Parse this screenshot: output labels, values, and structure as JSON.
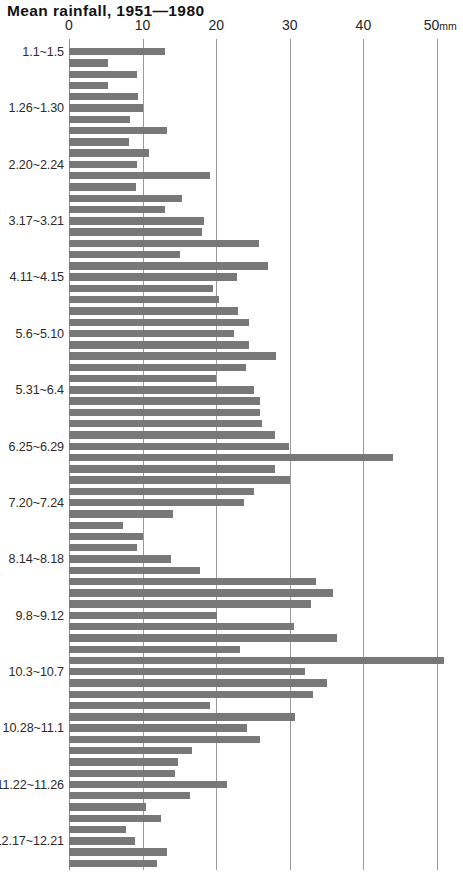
{
  "chart": {
    "title": "Mean rainfall, 1951—1980"
  },
  "axis": {
    "unit_suffix": "mm",
    "ticks": [
      {
        "label": "0",
        "value": 0
      },
      {
        "label": "10",
        "value": 10
      },
      {
        "label": "20",
        "value": 20
      },
      {
        "label": "30",
        "value": 30
      },
      {
        "label": "40",
        "value": 40
      },
      {
        "label": "50",
        "value": 50
      }
    ]
  },
  "category_labels": [
    {
      "label": "1.1~1.5",
      "index": 0
    },
    {
      "label": "1.26~1.30",
      "index": 5
    },
    {
      "label": "2.20~2.24",
      "index": 10
    },
    {
      "label": "3.17~3.21",
      "index": 15
    },
    {
      "label": "4.11~4.15",
      "index": 20
    },
    {
      "label": "5.6~5.10",
      "index": 25
    },
    {
      "label": "5.31~6.4",
      "index": 30
    },
    {
      "label": "6.25~6.29",
      "index": 35
    },
    {
      "label": "7.20~7.24",
      "index": 40
    },
    {
      "label": "8.14~8.18",
      "index": 45
    },
    {
      "label": "9.8~9.12",
      "index": 50
    },
    {
      "label": "10.3~10.7",
      "index": 55
    },
    {
      "label": "10.28~11.1",
      "index": 60
    },
    {
      "label": "11.22~11.26",
      "index": 65
    },
    {
      "label": "12.17~12.21",
      "index": 70
    }
  ],
  "colors": {
    "bar": "#787878",
    "grid": "#9a9a9a",
    "text": "#1a1a1a",
    "background": "#ffffff"
  },
  "chart_data": {
    "type": "bar",
    "orientation": "horizontal",
    "title": "Mean rainfall, 1951—1980",
    "xlabel": "mm",
    "ylabel": "",
    "xlim": [
      0,
      50
    ],
    "grid": true,
    "legend": false,
    "categories": [
      "1.1~1.5",
      "1.6~1.10",
      "1.11~1.15",
      "1.16~1.20",
      "1.21~1.25",
      "1.26~1.30",
      "1.31~2.4",
      "2.5~2.9",
      "2.10~2.14",
      "2.15~2.19",
      "2.20~2.24",
      "2.25~3.1",
      "3.2~3.6",
      "3.7~3.11",
      "3.12~3.16",
      "3.17~3.21",
      "3.22~3.26",
      "3.27~3.31",
      "4.1~4.5",
      "4.6~4.10",
      "4.11~4.15",
      "4.16~4.20",
      "4.21~4.25",
      "4.26~4.30",
      "5.1~5.5",
      "5.6~5.10",
      "5.11~5.15",
      "5.16~5.20",
      "5.21~5.25",
      "5.26~5.30",
      "5.31~6.4",
      "6.5~6.9",
      "6.10~6.14",
      "6.15~6.19",
      "6.20~6.24",
      "6.25~6.29",
      "6.30~7.4",
      "7.5~7.9",
      "7.10~7.14",
      "7.15~7.19",
      "7.20~7.24",
      "7.25~7.29",
      "7.30~8.3",
      "8.4~8.8",
      "8.9~8.13",
      "8.14~8.18",
      "8.19~8.23",
      "8.24~8.28",
      "8.29~9.2",
      "9.3~9.7",
      "9.8~9.12",
      "9.13~9.17",
      "9.18~9.22",
      "9.23~9.27",
      "9.28~10.2",
      "10.3~10.7",
      "10.8~10.12",
      "10.13~10.17",
      "10.18~10.22",
      "10.23~10.27",
      "10.28~11.1",
      "11.2~11.6",
      "11.7~11.11",
      "11.12~11.16",
      "11.17~11.21",
      "11.22~11.26",
      "11.27~12.1",
      "12.2~12.6",
      "12.7~12.11",
      "12.12~12.16",
      "12.17~12.21",
      "12.22~12.26",
      "12.27~12.31"
    ],
    "values": [
      13.1,
      5.3,
      9.3,
      5.3,
      9.4,
      10.1,
      8.3,
      13.3,
      8.2,
      10.9,
      9.2,
      19.2,
      9.1,
      15.4,
      13.0,
      18.3,
      18.1,
      25.8,
      15.1,
      27.0,
      22.8,
      19.5,
      20.4,
      23.0,
      24.5,
      22.4,
      24.4,
      28.1,
      24.1,
      20.0,
      25.1,
      26.0,
      26.0,
      26.2,
      28.0,
      29.9,
      44.0,
      28.0,
      30.0,
      25.1,
      23.8,
      14.1,
      7.4,
      10.1,
      9.3,
      13.9,
      17.8,
      33.6,
      35.9,
      32.9,
      20.1,
      30.6,
      36.4,
      23.3,
      51.0,
      32.1,
      35.1,
      33.1,
      19.2,
      30.7,
      24.2,
      26.0,
      16.7,
      14.8,
      14.4,
      21.5,
      16.5,
      10.4,
      12.5,
      7.7,
      9.0,
      13.3,
      12.0
    ]
  }
}
